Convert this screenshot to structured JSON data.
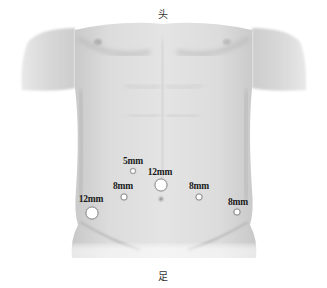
{
  "orientation": {
    "head_label": "头",
    "foot_label": "足"
  },
  "ports": [
    {
      "id": "port-5mm-upper-left",
      "label": "5mm",
      "size": "5mm",
      "label_x": 133,
      "label_y": 157,
      "x": 133,
      "y": 171
    },
    {
      "id": "port-12mm-umbilical",
      "label": "12mm",
      "size": "12mm",
      "label_x": 160,
      "label_y": 168,
      "x": 161,
      "y": 185
    },
    {
      "id": "port-8mm-left",
      "label": "8mm",
      "size": "8mm",
      "label_x": 123,
      "label_y": 182,
      "x": 124,
      "y": 197
    },
    {
      "id": "port-8mm-right",
      "label": "8mm",
      "size": "8mm",
      "label_x": 199,
      "label_y": 182,
      "x": 199,
      "y": 197
    },
    {
      "id": "port-12mm-far-left",
      "label": "12mm",
      "size": "12mm",
      "label_x": 91,
      "label_y": 195,
      "x": 92,
      "y": 213
    },
    {
      "id": "port-8mm-far-right",
      "label": "8mm",
      "size": "8mm",
      "label_x": 238,
      "label_y": 198,
      "x": 237,
      "y": 212
    }
  ],
  "colors": {
    "skin_light": "#e6e6e6",
    "skin_mid": "#cfcfcf",
    "skin_dark": "#b5b5b5",
    "port_fill": "#ffffff",
    "label_text": "#1a1a1a"
  }
}
